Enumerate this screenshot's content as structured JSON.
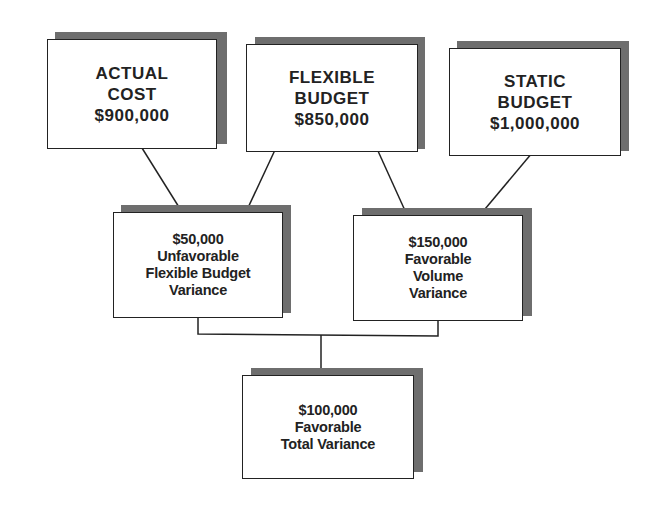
{
  "boxes": {
    "actual_cost": {
      "lines": [
        "ACTUAL",
        "COST",
        "$900,000"
      ]
    },
    "flexible_budget": {
      "lines": [
        "FLEXIBLE",
        "BUDGET",
        "$850,000"
      ]
    },
    "static_budget": {
      "lines": [
        "STATIC",
        "BUDGET",
        "$1,000,000"
      ]
    },
    "flexible_budget_variance": {
      "lines": [
        "$50,000",
        "Unfavorable",
        "Flexible Budget",
        "Variance"
      ]
    },
    "volume_variance": {
      "lines": [
        "$150,000",
        "Favorable",
        "Volume",
        "Variance"
      ]
    },
    "total_variance": {
      "lines": [
        "$100,000",
        "Favorable",
        "Total Variance"
      ]
    }
  },
  "colors": {
    "border": "#222222",
    "shadow": "#6e6e6e",
    "background": "#ffffff"
  }
}
